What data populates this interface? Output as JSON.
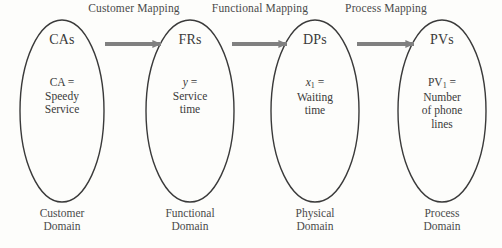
{
  "diagram": {
    "background_color": "#fdfdfb",
    "ellipse_stroke_color": "#3a3a3a",
    "arrow_color": "#808080",
    "text_color": "#3a3a3a"
  },
  "mappings": [
    {
      "label": "Customer Mapping"
    },
    {
      "label": "Functional Mapping"
    },
    {
      "label": "Process Mapping"
    }
  ],
  "nodes": [
    {
      "title": "CAs",
      "variable": "CA",
      "variable_subscript": "",
      "variable_italic": false,
      "equals": "=",
      "value_lines": [
        "Speedy",
        "Service"
      ],
      "domain_lines": [
        "Customer",
        "Domain"
      ]
    },
    {
      "title": "FRs",
      "variable": "y",
      "variable_subscript": "",
      "variable_italic": true,
      "equals": "=",
      "value_lines": [
        "Service",
        "time"
      ],
      "domain_lines": [
        "Functional",
        "Domain"
      ]
    },
    {
      "title": "DPs",
      "variable": "x",
      "variable_subscript": "1",
      "variable_italic": true,
      "equals": "=",
      "value_lines": [
        "Waiting",
        "time"
      ],
      "domain_lines": [
        "Physical",
        "Domain"
      ]
    },
    {
      "title": "PVs",
      "variable": "PV",
      "variable_subscript": "1",
      "variable_italic": false,
      "equals": "=",
      "value_lines": [
        "Number",
        "of phone",
        "lines"
      ],
      "domain_lines": [
        "Process",
        "Domain"
      ]
    }
  ]
}
